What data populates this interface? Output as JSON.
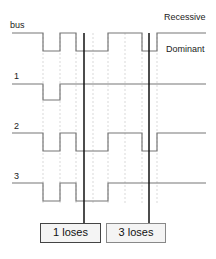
{
  "labels": {
    "bus": "bus",
    "recessive": "Recessive",
    "dominant": "Dominant",
    "node1": "1",
    "node2": "2",
    "node3": "3"
  },
  "results": {
    "box1": "1 loses",
    "box2": "3 loses"
  },
  "signals": {
    "bus": "1 0 1 0 0 1 0 1",
    "node1": "1 0 1 1 1 1 1 1",
    "node2": "1 0 1 0 0 1 0 1",
    "node3": "1 0 1 0 0 1 1 1"
  }
}
